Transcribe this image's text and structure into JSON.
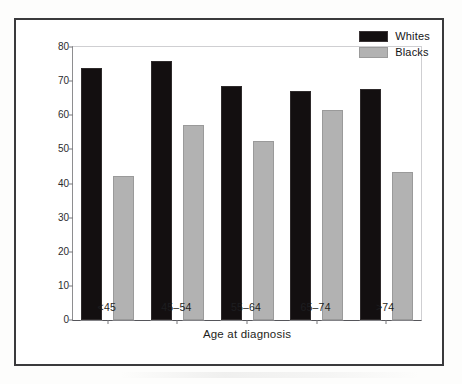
{
  "figure": {
    "y_axis_title": "Percent survival",
    "x_axis_title": "Age at diagnosis"
  },
  "legend": {
    "items": [
      {
        "label": "Whites",
        "color": "#130f10",
        "swatch_name": "legend-swatch-whites"
      },
      {
        "label": "Blacks",
        "color": "#b2b2b2",
        "swatch_name": "legend-swatch-blacks"
      }
    ]
  },
  "chart_data": {
    "type": "bar",
    "title": "",
    "xlabel": "Age at diagnosis",
    "ylabel": "Percent survival",
    "categories": [
      "<45",
      "45–54",
      "55–64",
      "65–74",
      ">74"
    ],
    "series": [
      {
        "name": "Whites",
        "color": "#130f10",
        "values": [
          73.8,
          75.8,
          68.5,
          67.2,
          67.7
        ]
      },
      {
        "name": "Blacks",
        "color": "#b2b2b2",
        "values": [
          42.1,
          57.2,
          52.4,
          61.4,
          43.5
        ]
      }
    ],
    "ylim": [
      0,
      80
    ],
    "ytick_values": [
      0,
      10,
      20,
      30,
      40,
      50,
      60,
      70,
      80
    ],
    "ytick_labels": [
      "0",
      "10",
      "20",
      "30",
      "40",
      "50",
      "60",
      "70",
      "80"
    ],
    "grid": false,
    "legend_position": "top-right"
  }
}
